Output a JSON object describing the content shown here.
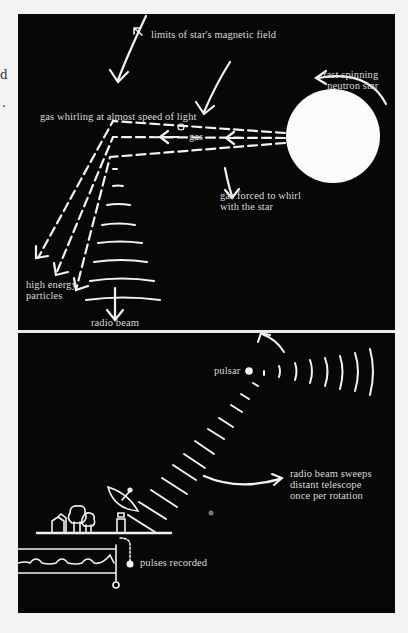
{
  "margin_fragments": [
    "d",
    "."
  ],
  "top_panel": {
    "labels": {
      "magnetic_field": "limits of star's magnetic field",
      "neutron_star": "fast spinning\nneutron star",
      "gas_whirling": "gas whirling at almost speed of light",
      "gas": "gas",
      "gas_forced": "gas forced to whirl\nwith the star",
      "particles": "high energy\nparticles",
      "radio_beam": "radio beam"
    }
  },
  "bottom_panel": {
    "labels": {
      "pulsar": "pulsar",
      "sweeps": "radio beam sweeps\ndistant telescope\nonce per rotation",
      "pulses": "pulses recorded"
    }
  },
  "colors": {
    "background": "#070707",
    "ink": "#f2f2f2",
    "label": "#d9d9d9",
    "page": "#f3f3f1"
  }
}
